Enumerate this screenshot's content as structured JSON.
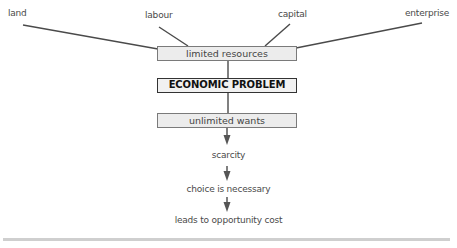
{
  "diagram": {
    "factors": [
      {
        "id": "land",
        "label": "land"
      },
      {
        "id": "labour",
        "label": "labour"
      },
      {
        "id": "capital",
        "label": "capital"
      },
      {
        "id": "enterprise",
        "label": "enterprise"
      }
    ],
    "boxes": {
      "limited_resources": "limited resources",
      "economic_problem": "ECONOMIC PROBLEM",
      "unlimited_wants": "unlimited wants"
    },
    "chain": [
      {
        "id": "scarcity",
        "label": "scarcity"
      },
      {
        "id": "choice",
        "label": "choice is necessary"
      },
      {
        "id": "opportunity_cost",
        "label": "leads to opportunity cost"
      }
    ],
    "colors": {
      "line": "#4a4a4a",
      "box_fill": "#ececec",
      "box_border": "#7a7a7a",
      "bold_border": "#333333",
      "rule": "#cfcfcf"
    }
  }
}
